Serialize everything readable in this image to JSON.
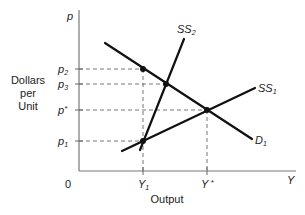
{
  "diagram": {
    "y_axis": {
      "symbol": "p",
      "title_lines": [
        "Dollars",
        "per",
        "Unit"
      ]
    },
    "x_axis": {
      "symbol": "Y",
      "title": "Output",
      "origin_label": "0"
    },
    "price_ticks": [
      {
        "base": "p",
        "sub": "2",
        "sup": ""
      },
      {
        "base": "p",
        "sub": "3",
        "sup": ""
      },
      {
        "base": "p",
        "sub": "",
        "sup": "*"
      },
      {
        "base": "p",
        "sub": "1",
        "sup": ""
      }
    ],
    "output_ticks": [
      {
        "base": "Y",
        "sub": "1",
        "sup": ""
      },
      {
        "base": "Y",
        "sub": "",
        "sup": " *"
      }
    ],
    "curves": [
      {
        "id": "D1",
        "base": "D",
        "sub": "1",
        "kind": "demand"
      },
      {
        "id": "SS1",
        "base": "SS",
        "sub": "1",
        "kind": "short-run supply"
      },
      {
        "id": "SS2",
        "base": "SS",
        "sub": "2",
        "kind": "short-run supply"
      }
    ],
    "points": [
      {
        "name": "p2-at-Y1",
        "on": [
          "D1"
        ],
        "x": "Y1",
        "y": "p2"
      },
      {
        "name": "p3",
        "on": [
          "D1",
          "SS2"
        ],
        "x": "",
        "y": "p3"
      },
      {
        "name": "equilibrium",
        "on": [
          "D1",
          "SS1"
        ],
        "x": "Y*",
        "y": "p*"
      },
      {
        "name": "p1-at-Y1",
        "on": [
          "SS1",
          "SS2"
        ],
        "x": "Y1",
        "y": "p1"
      }
    ]
  }
}
